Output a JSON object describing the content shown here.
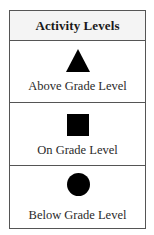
{
  "legend": {
    "title": "Activity Levels",
    "items": [
      {
        "symbol": "triangle-icon",
        "label": "Above Grade Level"
      },
      {
        "symbol": "square-icon",
        "label": "On Grade Level"
      },
      {
        "symbol": "circle-icon",
        "label": "Below Grade Level"
      }
    ]
  },
  "colors": {
    "symbol": "#000000",
    "border": "#555555",
    "header_bg": "#f4f4f4"
  }
}
